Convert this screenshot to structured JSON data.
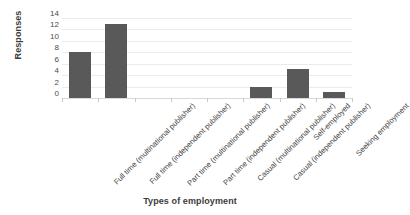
{
  "chart_data": {
    "type": "bar",
    "title": "",
    "xlabel": "Types of employment",
    "ylabel": "Responses",
    "categories": [
      "Full time (multinational publisher)",
      "Full time (independent publisher)",
      "Part time (multinational publisher)",
      "Part time (independent publisher)",
      "Casual (multinational publisher)",
      "Casual (independent publisher)",
      "Self-employed",
      "Seeking employment"
    ],
    "values": [
      8,
      13,
      0,
      0,
      0,
      2,
      5,
      1
    ],
    "ylim": [
      0,
      14
    ],
    "yticks": [
      0,
      2,
      4,
      6,
      8,
      10,
      12,
      14
    ],
    "ytick_labels": [
      "0",
      "2",
      "4",
      "6",
      "8",
      "10",
      "12",
      "14"
    ],
    "grid": true,
    "grid_axis": "y",
    "legend": false,
    "bar_color": "#595959",
    "grid_color": "#ebebeb",
    "axis_color": "#d9d9d9",
    "text_color": "#3c3c3c",
    "background": "#ffffff",
    "xtick_rotation": -45
  }
}
